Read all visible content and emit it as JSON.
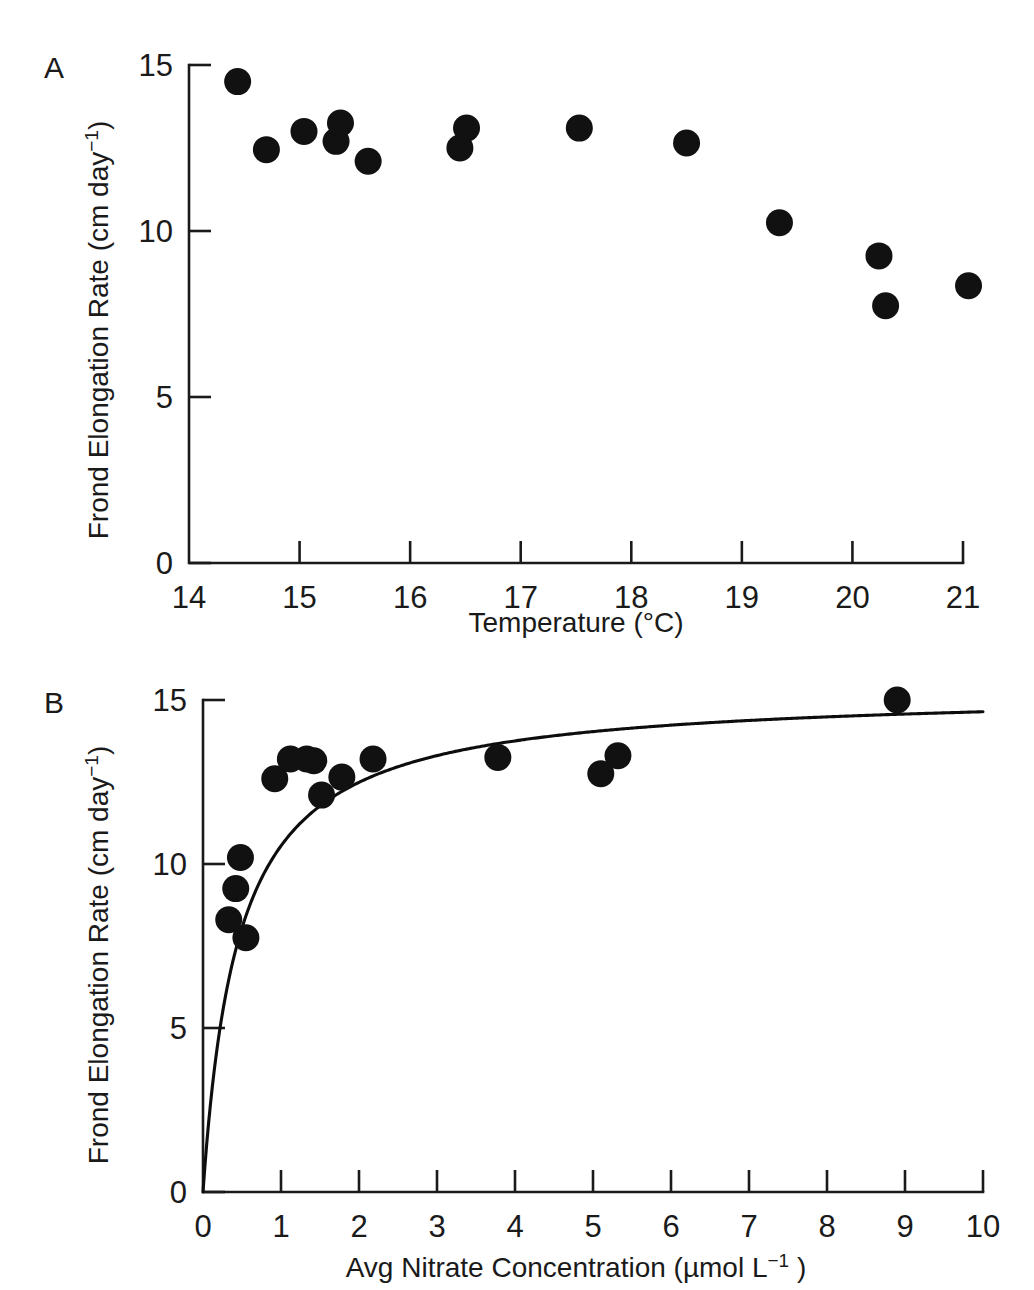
{
  "figure": {
    "panels": [
      {
        "letter": "A",
        "id": "panel-a",
        "ylabel": "Frond Elongation Rate (cm day",
        "ylabel_sup": "−1",
        "ylabel_tail": ")",
        "xlabel": "Temperature (°C)",
        "xlabel_sup": "",
        "xlabel_tail": ""
      },
      {
        "letter": "B",
        "id": "panel-b",
        "ylabel": "Frond Elongation Rate (cm day",
        "ylabel_sup": "−1",
        "ylabel_tail": ")",
        "xlabel": "Avg Nitrate Concentration (µmol L",
        "xlabel_sup": "−1",
        "xlabel_tail": " )"
      }
    ]
  },
  "chart_data": [
    {
      "type": "scatter",
      "panel": "A",
      "title": "",
      "xlabel": "Temperature (°C)",
      "ylabel": "Frond Elongation Rate (cm day−1)",
      "xlim": [
        14,
        21
      ],
      "ylim": [
        0,
        15
      ],
      "xticks": [
        14,
        15,
        16,
        17,
        18,
        19,
        20,
        21
      ],
      "xtick_labels": [
        "14",
        "15",
        "16",
        "17",
        "18",
        "19",
        "20",
        "21"
      ],
      "yticks": [
        0,
        5,
        10,
        15
      ],
      "ytick_labels": [
        "0",
        "5",
        "10",
        "15"
      ],
      "grid": false,
      "legend": false,
      "marker": "filled-circle",
      "marker_color": "#111111",
      "points": [
        {
          "x": 14.44,
          "y": 14.5
        },
        {
          "x": 14.7,
          "y": 12.45
        },
        {
          "x": 15.04,
          "y": 13.0
        },
        {
          "x": 15.33,
          "y": 12.7
        },
        {
          "x": 15.37,
          "y": 13.25
        },
        {
          "x": 15.62,
          "y": 12.1
        },
        {
          "x": 16.45,
          "y": 12.5
        },
        {
          "x": 16.51,
          "y": 13.1
        },
        {
          "x": 17.53,
          "y": 13.1
        },
        {
          "x": 18.5,
          "y": 12.65
        },
        {
          "x": 19.34,
          "y": 10.25
        },
        {
          "x": 20.24,
          "y": 9.25
        },
        {
          "x": 20.3,
          "y": 7.75
        },
        {
          "x": 21.05,
          "y": 8.35
        }
      ]
    },
    {
      "type": "scatter",
      "panel": "B",
      "title": "",
      "xlabel": "Avg Nitrate Concentration (µmol L−1 )",
      "ylabel": "Frond Elongation Rate (cm day−1)",
      "xlim": [
        0,
        10
      ],
      "ylim": [
        0,
        15
      ],
      "xticks": [
        0,
        1,
        2,
        3,
        4,
        5,
        6,
        7,
        8,
        9,
        10
      ],
      "xtick_labels": [
        "0",
        "1",
        "2",
        "3",
        "4",
        "5",
        "6",
        "7",
        "8",
        "9",
        "10"
      ],
      "yticks": [
        0,
        5,
        10,
        15
      ],
      "ytick_labels": [
        "0",
        "5",
        "10",
        "15"
      ],
      "grid": false,
      "legend": false,
      "marker": "filled-circle",
      "marker_color": "#111111",
      "points": [
        {
          "x": 0.33,
          "y": 8.3
        },
        {
          "x": 0.42,
          "y": 9.25
        },
        {
          "x": 0.48,
          "y": 10.2
        },
        {
          "x": 0.55,
          "y": 7.75
        },
        {
          "x": 0.92,
          "y": 12.6
        },
        {
          "x": 1.12,
          "y": 13.2
        },
        {
          "x": 1.33,
          "y": 13.2
        },
        {
          "x": 1.42,
          "y": 13.15
        },
        {
          "x": 1.52,
          "y": 12.1
        },
        {
          "x": 1.78,
          "y": 12.65
        },
        {
          "x": 2.18,
          "y": 13.2
        },
        {
          "x": 3.78,
          "y": 13.25
        },
        {
          "x": 5.1,
          "y": 12.75
        },
        {
          "x": 5.32,
          "y": 13.3
        },
        {
          "x": 8.9,
          "y": 15.0
        }
      ],
      "fit_curve": {
        "model": "michaelis-menten",
        "equation": "y = Vmax * x / (Ks + x)",
        "vmax": 15.3,
        "ks": 0.45
      }
    }
  ]
}
